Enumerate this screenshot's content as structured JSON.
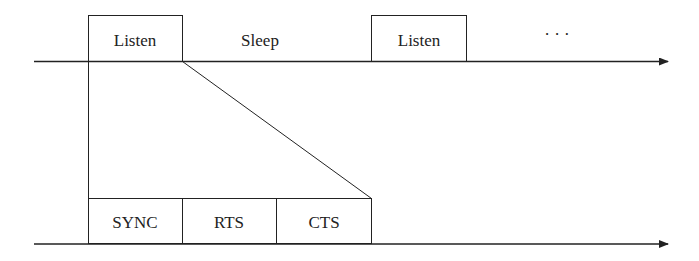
{
  "diagram": {
    "type": "timing-diagram",
    "top_timeline": {
      "segments": [
        {
          "label": "Listen",
          "boxed": true
        },
        {
          "label": "Sleep",
          "boxed": false
        },
        {
          "label": "Listen",
          "boxed": true
        },
        {
          "label": "· · ·",
          "boxed": false
        }
      ]
    },
    "bottom_timeline": {
      "segments": [
        {
          "label": "SYNC"
        },
        {
          "label": "RTS"
        },
        {
          "label": "CTS"
        }
      ]
    },
    "colors": {
      "line": "#222222",
      "background": "#ffffff"
    }
  }
}
